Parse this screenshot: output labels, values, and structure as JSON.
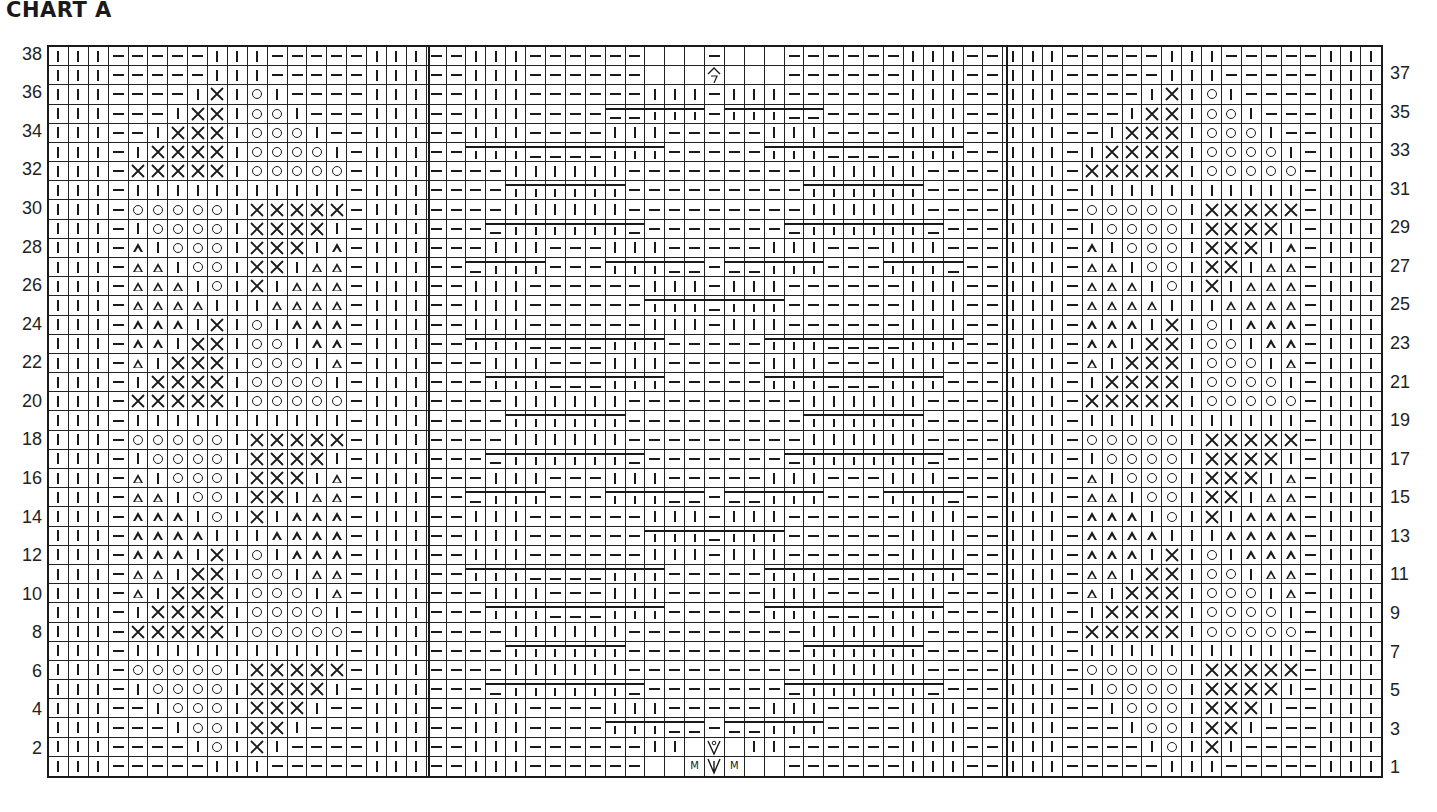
{
  "title": "CHART A",
  "chart": {
    "columns": 67,
    "rows": 38,
    "left_row_numbers": [
      "38",
      "36",
      "34",
      "32",
      "30",
      "28",
      "26",
      "24",
      "22",
      "20",
      "18",
      "16",
      "14",
      "12",
      "10",
      "8",
      "6",
      "4",
      "2"
    ],
    "right_row_numbers": [
      "37",
      "35",
      "33",
      "31",
      "29",
      "27",
      "25",
      "23",
      "21",
      "19",
      "17",
      "15",
      "13",
      "11",
      "9",
      "7",
      "5",
      "3",
      "1"
    ],
    "legend_codes": {
      "|": "knit",
      "-": "purl",
      "X": "cross",
      "o": "circle",
      "^": "triangle",
      ".": "no-stitch",
      "k": "knit-under-cable",
      "q": "purl-under-cable",
      "M": "make-one",
      "V": "central-decrease",
      "v": "central-decrease-yo",
      "7": "top-decrease"
    },
    "side_panel_rows": [
      "|||-----|||-----|||",
      "|||-----|||-----|||",
      "|||----|X|o|----|||",
      "|||---|XX|oo|---|||",
      "|||--|XXX|ooo|--|||",
      "|||-|XXXX|oooo|-|||",
      "|||-XXXXX|ooooo-|||",
      "|||-|||||||||||-|||",
      "|||-ooooo|XXXXX-|||",
      "|||-|oooo|XXXX|-|||",
      "|||-^|ooo|XXX|^-|||",
      "|||-^^|oo|XX|^^-|||",
      "|||-^^^|o|X|^^^-|||",
      "|||-^^^^|||^^^^-|||",
      "|||-^^^|X|o|^^^-|||",
      "|||-^^|XX|oo|^^-|||",
      "|||-^|XXX|ooo|^-|||",
      "|||-|XXXX|oooo|-|||",
      "|||-XXXXX|ooooo-|||",
      "|||-|||||||||||-|||",
      "|||-ooooo|XXXXX-|||",
      "|||-|oooo|XXXX|-|||",
      "|||-^|ooo|XXX|^-|||",
      "|||-^^|oo|XX|^^-|||",
      "|||-^^^|o|X|^^^-|||",
      "|||-^^^^|||^^^^-|||",
      "|||-^^^|X|o|^^^-|||",
      "|||-^^|XX|oo|^^-|||",
      "|||-^|XXX|ooo|^-|||",
      "|||-|XXXX|oooo|-|||",
      "|||-XXXXX|ooooo-|||",
      "|||-|||||||||||-|||",
      "|||-ooooo|XXXXX-|||",
      "|||-|oooo|XXXX|-|||",
      "|||--|ooo|XXX|--|||",
      "|||---|oo|XX|---|||",
      "|||----|o|X|----|||",
      "|||-----|||-----|||"
    ],
    "center_panel_rows": [
      "--|||------...-...------|||--",
      "--|||------...7...------|||--",
      "--|||------|||-|||------|||--",
      "--|||----qqkkk-kkkqq----|||--",
      "--|||----|||-----|||----|||--",
      "--kkkqqqqkkk-----kkkqqqqkkk--",
      "----||||||---------||||||----",
      "----kkkkkk---------kkkkkk----",
      "----||||||---------||||||----",
      "---qkkkkkkq-------qkkkkkkq---",
      "---|||---|||-----|||---|||---",
      "--qkkk---kkkqq-qqkkk---kkkq--",
      "--|||------|||-|||------|||--",
      "--|||------kkkqkkk------|||--",
      "--|||------|||-|||------|||--",
      "--kkkqqqqkkk-----kkkqqqqkkk--",
      "---|||---|||-----|||---|||---",
      "---kkkqqqkkk-----kkkqqqkkk---",
      "----||||||---------||||||----",
      "----kkkkkk---------kkkkkk----",
      "----||||||---------||||||----",
      "---qkkkkkkq-------qkkkkkkq---",
      "---|||---|||-----|||---|||---",
      "--qkkk---kkkqq-qqkkk---kkkq--",
      "--|||------|||-|||------|||--",
      "--|||------kkkqkkk------|||--",
      "--|||------|||-|||------|||--",
      "--kkkqqqqkkk-----kkkqqqqkkk--",
      "---|||---|||-----|||---|||---",
      "---kkkqqqkkk-----kkkqqqkkk---",
      "----||||||---------||||||----",
      "----kkkkkk---------kkkkkk----",
      "----||||||---------||||||----",
      "---qkkkkkkq-------qkkkkkkq---",
      "--|||----|||-----|||----|||--",
      "--|||----kkkqq-qqkkk----|||--",
      "--|||------||.v.||------|||--",
      "--|||------..MVM..------|||--"
    ]
  },
  "colors": {
    "ink": "#1a1a1a",
    "background": "#ffffff"
  }
}
